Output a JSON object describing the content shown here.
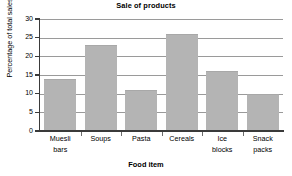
{
  "chart_data": {
    "type": "bar",
    "title": "Sale of products",
    "xlabel": "Food item",
    "ylabel": "Percentage of total sales",
    "categories": [
      "Muesli bars",
      "Soups",
      "Pasta",
      "Cereals",
      "Ice blocks",
      "Snack packs"
    ],
    "category_lines": [
      [
        "Muesli",
        "bars"
      ],
      [
        "Soups",
        ""
      ],
      [
        "Pasta",
        ""
      ],
      [
        "Cereals",
        ""
      ],
      [
        "Ice",
        "blocks"
      ],
      [
        "Snack",
        "packs"
      ]
    ],
    "values": [
      14,
      23,
      11,
      26,
      16,
      10
    ],
    "ylim": [
      0,
      30
    ],
    "yticks": [
      0,
      5,
      10,
      15,
      20,
      25,
      30
    ],
    "ytick_labels": [
      "0",
      "5",
      "10",
      "15",
      "20",
      "25",
      "30"
    ],
    "grid": true,
    "grid_axis": "y",
    "legend": false,
    "bar_color": "#b4b4b4",
    "axis_color": "#3a3a3a",
    "grid_color": "#9a9a9a",
    "background": "#ffffff"
  }
}
